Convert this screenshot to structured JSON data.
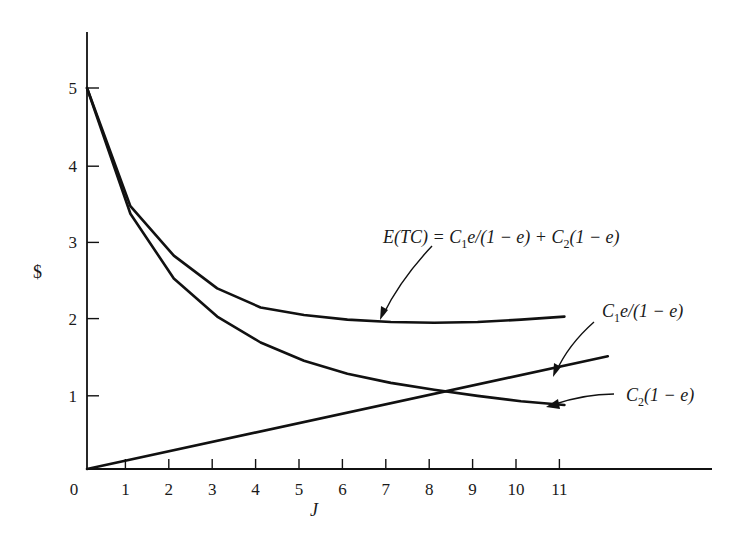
{
  "chart_data": {
    "type": "line",
    "title": "",
    "xlabel": "J",
    "ylabel": "$",
    "xlim": [
      0,
      14
    ],
    "ylim": [
      0,
      5.8
    ],
    "x_ticks": [
      "0",
      "1",
      "2",
      "3",
      "4",
      "5",
      "6",
      "7",
      "8",
      "9",
      "10",
      "11"
    ],
    "y_ticks": [
      "1",
      "2",
      "3",
      "4",
      "5"
    ],
    "grid": false,
    "legend": "none (curves labeled by annotations with arrows)",
    "x": [
      0,
      1,
      2,
      3,
      4,
      5,
      6,
      7,
      8,
      9,
      10,
      11
    ],
    "series": [
      {
        "name": "E(TC) = C1e/(1 − e) + C2(1 − e)",
        "x": [
          0,
          1,
          2,
          3,
          4,
          5,
          6,
          7,
          8,
          9,
          10,
          11
        ],
        "values": [
          5.0,
          3.45,
          2.8,
          2.37,
          2.12,
          2.02,
          1.96,
          1.93,
          1.92,
          1.93,
          1.96,
          2.0
        ]
      },
      {
        "name": "C2(1 − e)",
        "x": [
          0,
          1,
          2,
          3,
          4,
          5,
          6,
          7,
          8,
          9,
          10,
          11
        ],
        "values": [
          5.0,
          3.35,
          2.5,
          2.0,
          1.66,
          1.42,
          1.25,
          1.13,
          1.04,
          0.96,
          0.89,
          0.84
        ]
      },
      {
        "name": "C1e/(1 − e)",
        "x": [
          0,
          12
        ],
        "values": [
          0.0,
          1.48
        ]
      }
    ],
    "annotations": [
      {
        "text": "E(TC) = C1e/(1 − e) + C2(1 − e)",
        "points_to": "total cost curve near J=7"
      },
      {
        "text": "C1e/(1 − e)",
        "points_to": "linear curve near J=10.5"
      },
      {
        "text": "C2(1 − e)",
        "points_to": "decreasing curve end near J=11"
      }
    ]
  },
  "labels": {
    "ylabel": "$",
    "xlabel": "J",
    "origin": "0",
    "total_prefix": "E(TC) = C",
    "total_sub1": "1",
    "total_mid": "e/(1 − e) + C",
    "total_sub2": "2",
    "total_suffix": "(1 − e)",
    "c1_prefix": "C",
    "c1_sub": "1",
    "c1_suffix": "e/(1 − e)",
    "c2_prefix": "C",
    "c2_sub": "2",
    "c2_suffix": "(1 − e)"
  }
}
